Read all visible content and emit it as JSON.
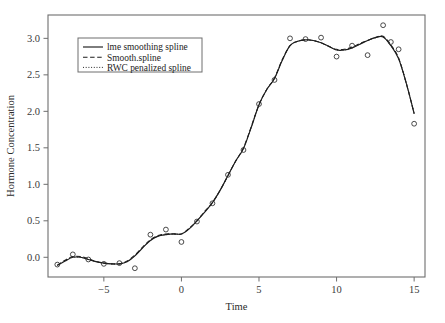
{
  "chart_data": {
    "type": "line",
    "title": "",
    "xlabel": "Time",
    "ylabel": "Hormone Concentration",
    "xlim": [
      -8.6,
      15.7
    ],
    "ylim": [
      -0.27,
      3.32
    ],
    "xticks": [
      -5,
      0,
      5,
      10,
      15
    ],
    "xticklabels": [
      "−5",
      "0",
      "5",
      "10",
      "15"
    ],
    "yticks": [
      0.0,
      0.5,
      1.0,
      1.5,
      2.0,
      2.5,
      3.0
    ],
    "yticklabels": [
      "0.0",
      "0.5",
      "1.0",
      "1.5",
      "2.0",
      "2.5",
      "3.0"
    ],
    "grid": false,
    "legend_position": "upper-left",
    "legend": [
      {
        "label": "lme smoothing spline",
        "style": "solid"
      },
      {
        "label": "Smooth.spline",
        "style": "dashed"
      },
      {
        "label": "RWC penalized spline",
        "style": "dotted"
      }
    ],
    "scatter": {
      "name": "observed hormone concentration",
      "marker": "open-circle",
      "x": [
        -8,
        -7,
        -6,
        -5,
        -4,
        -3,
        -2,
        -1,
        0,
        1,
        2,
        3,
        4,
        5,
        6,
        7,
        8,
        9,
        10,
        11,
        12,
        13,
        13.5,
        14,
        15
      ],
      "y": [
        -0.1,
        0.04,
        -0.03,
        -0.09,
        -0.08,
        -0.15,
        0.31,
        0.38,
        0.21,
        0.49,
        0.74,
        1.13,
        1.47,
        2.1,
        2.43,
        3.0,
        2.99,
        3.01,
        2.75,
        2.9,
        2.77,
        3.18,
        2.95,
        2.85,
        1.83
      ]
    },
    "series": [
      {
        "name": "lme smoothing spline",
        "style": "solid",
        "x": [
          -8,
          -7.5,
          -7,
          -6.5,
          -6,
          -5.5,
          -5,
          -4.5,
          -4,
          -3.5,
          -3,
          -2.5,
          -2,
          -1.5,
          -1,
          -0.5,
          0,
          0.5,
          1,
          1.5,
          2,
          2.5,
          3,
          3.5,
          4,
          4.5,
          5,
          5.5,
          6,
          6.5,
          7,
          7.5,
          8,
          8.5,
          9,
          9.5,
          10,
          10.5,
          11,
          11.5,
          12,
          12.5,
          13,
          13.5,
          14,
          14.5,
          15
        ],
        "y": [
          -0.11,
          -0.05,
          0.0,
          0.0,
          -0.03,
          -0.06,
          -0.08,
          -0.09,
          -0.09,
          -0.06,
          0.02,
          0.13,
          0.23,
          0.29,
          0.31,
          0.32,
          0.32,
          0.39,
          0.5,
          0.62,
          0.75,
          0.92,
          1.12,
          1.32,
          1.49,
          1.78,
          2.09,
          2.3,
          2.45,
          2.7,
          2.9,
          2.96,
          2.98,
          2.97,
          2.94,
          2.89,
          2.84,
          2.84,
          2.87,
          2.92,
          2.97,
          3.01,
          3.02,
          2.9,
          2.72,
          2.38,
          1.97
        ]
      },
      {
        "name": "Smooth.spline",
        "style": "dashed",
        "x": [
          -8,
          -7.5,
          -7,
          -6.5,
          -6,
          -5.5,
          -5,
          -4.5,
          -4,
          -3.5,
          -3,
          -2.5,
          -2,
          -1.5,
          -1,
          -0.5,
          0,
          0.5,
          1,
          1.5,
          2,
          2.5,
          3,
          3.5,
          4,
          4.5,
          5,
          5.5,
          6,
          6.5,
          7,
          7.5,
          8,
          8.5,
          9,
          9.5,
          10,
          10.5,
          11,
          11.5,
          12,
          12.5,
          13,
          13.5,
          14,
          14.5,
          15
        ],
        "y": [
          -0.11,
          -0.04,
          0.01,
          0.01,
          -0.02,
          -0.06,
          -0.08,
          -0.09,
          -0.09,
          -0.05,
          0.03,
          0.14,
          0.24,
          0.3,
          0.32,
          0.32,
          0.32,
          0.4,
          0.5,
          0.63,
          0.75,
          0.92,
          1.12,
          1.32,
          1.5,
          1.79,
          2.09,
          2.3,
          2.46,
          2.71,
          2.9,
          2.96,
          2.98,
          2.97,
          2.94,
          2.89,
          2.85,
          2.85,
          2.88,
          2.93,
          2.97,
          3.01,
          3.03,
          2.91,
          2.73,
          2.38,
          1.97
        ]
      },
      {
        "name": "RWC penalized spline",
        "style": "dotted",
        "x": [
          -8,
          -7.5,
          -7,
          -6.5,
          -6,
          -5.5,
          -5,
          -4.5,
          -4,
          -3.5,
          -3,
          -2.5,
          -2,
          -1.5,
          -1,
          -0.5,
          0,
          0.5,
          1,
          1.5,
          2,
          2.5,
          3,
          3.5,
          4,
          4.5,
          5,
          5.5,
          6,
          6.5,
          7,
          7.5,
          8,
          8.5,
          9,
          9.5,
          10,
          10.5,
          11,
          11.5,
          12,
          12.5,
          13,
          13.5,
          14,
          14.5,
          15
        ],
        "y": [
          -0.11,
          -0.05,
          0.0,
          0.0,
          -0.03,
          -0.06,
          -0.08,
          -0.09,
          -0.09,
          -0.06,
          0.02,
          0.13,
          0.23,
          0.29,
          0.31,
          0.32,
          0.32,
          0.39,
          0.5,
          0.62,
          0.75,
          0.92,
          1.12,
          1.32,
          1.49,
          1.78,
          2.09,
          2.3,
          2.45,
          2.7,
          2.9,
          2.96,
          2.98,
          2.97,
          2.94,
          2.89,
          2.84,
          2.84,
          2.87,
          2.92,
          2.97,
          3.01,
          3.02,
          2.9,
          2.72,
          2.38,
          1.97
        ]
      }
    ],
    "colors": {
      "line": "#1d1d1d",
      "marker": "#2a2a2a",
      "frame": "#6e6e6e",
      "background": "#ffffff"
    }
  }
}
